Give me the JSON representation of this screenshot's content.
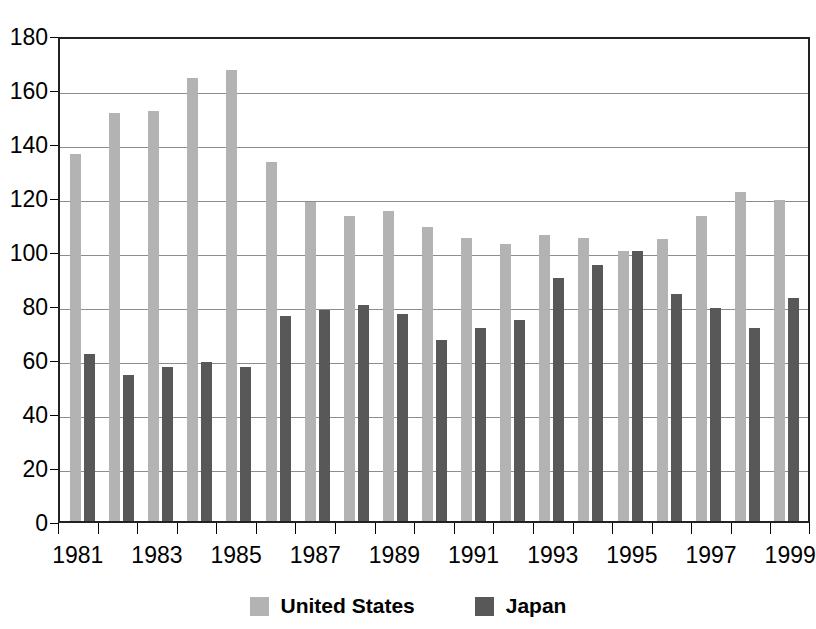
{
  "chart_data": {
    "type": "bar",
    "title": "",
    "subtitle": "",
    "xlabel": "",
    "ylabel": "",
    "ylim": [
      0,
      180
    ],
    "ytick_step": 20,
    "yticks": [
      180,
      160,
      140,
      120,
      100,
      80,
      60,
      40,
      20,
      0
    ],
    "grid": true,
    "legend_position": "bottom",
    "categories": [
      "1981",
      "1982",
      "1983",
      "1984",
      "1985",
      "1986",
      "1987",
      "1988",
      "1989",
      "1990",
      "1991",
      "1992",
      "1993",
      "1994",
      "1995",
      "1996",
      "1997",
      "1998",
      "1999"
    ],
    "xtick_labels": [
      "1981",
      "",
      "1983",
      "",
      "1985",
      "",
      "1987",
      "",
      "1989",
      "",
      "1991",
      "",
      "1993",
      "",
      "1995",
      "",
      "1997",
      "",
      "1999"
    ],
    "series": [
      {
        "name": "United States",
        "color": "#b3b3b3",
        "values": [
          136,
          151,
          152,
          164,
          167,
          133,
          118,
          113,
          115,
          109,
          105,
          102.5,
          106,
          105,
          100,
          104.5,
          113,
          122,
          119
        ]
      },
      {
        "name": "Japan",
        "color": "#585858",
        "values": [
          62,
          54,
          57,
          59,
          57,
          76,
          78,
          80,
          76.5,
          67,
          71.5,
          74.5,
          90,
          95,
          100,
          84,
          79,
          71.5,
          82.5
        ]
      }
    ]
  },
  "legend": {
    "items": [
      {
        "label": "United States",
        "color": "#b3b3b3"
      },
      {
        "label": "Japan",
        "color": "#585858"
      }
    ]
  }
}
